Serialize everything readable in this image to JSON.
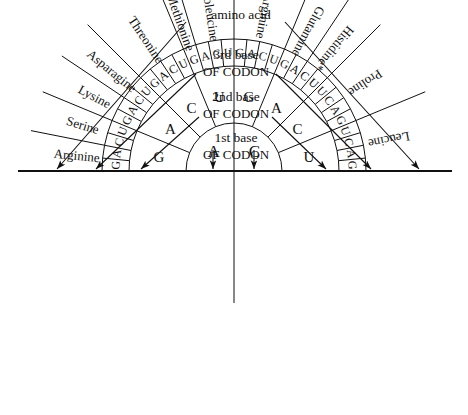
{
  "header": {
    "amino_acid": "amino acid",
    "third_base_l1": "3rd base",
    "third_base_l2": "OF CODON",
    "second_base_l1": "2nd base",
    "second_base_l2": "OF CODON",
    "first_base_l1": "1st base",
    "first_base_l2": "OF CODON"
  },
  "colors": {
    "line": "#111111",
    "background": "#ffffff",
    "text": "#111111"
  },
  "wheel": {
    "center_x": 234,
    "center_y": 171,
    "r_inner": 48,
    "r_ring2": 105,
    "r_ring3": 132,
    "r_labels": 175
  },
  "ring1_first_base": [
    {
      "letter": "A",
      "start_deg": 180,
      "end_deg": 270
    },
    {
      "letter": "C",
      "start_deg": 270,
      "end_deg": 360
    }
  ],
  "ring2_second_base": [
    {
      "letter": "G",
      "start_deg": 180,
      "end_deg": 202.5
    },
    {
      "letter": "A",
      "start_deg": 202.5,
      "end_deg": 225
    },
    {
      "letter": "C",
      "start_deg": 225,
      "end_deg": 247.5
    },
    {
      "letter": "U",
      "start_deg": 247.5,
      "end_deg": 270
    },
    {
      "letter": "G",
      "start_deg": 270,
      "end_deg": 292.5
    },
    {
      "letter": "A",
      "start_deg": 292.5,
      "end_deg": 315
    },
    {
      "letter": "C",
      "start_deg": 315,
      "end_deg": 337.5
    },
    {
      "letter": "U",
      "start_deg": 337.5,
      "end_deg": 360
    }
  ],
  "ring3_third_base": [
    "G",
    "A",
    "C",
    "U",
    "G",
    "A",
    "C",
    "U",
    "G",
    "A",
    "C",
    "U",
    "G",
    "A",
    "C",
    "U",
    "G",
    "A",
    "C",
    "U",
    "G",
    "A",
    "C",
    "U",
    "U",
    "C",
    "A",
    "G",
    "U",
    "C",
    "A",
    "G"
  ],
  "amino_acids": [
    {
      "name": "Arginine",
      "third_bases": [
        "G",
        "A"
      ],
      "mid_deg": 185.5
    },
    {
      "name": "Serine",
      "third_bases": [
        "C",
        "U"
      ],
      "mid_deg": 196.5
    },
    {
      "name": "Lysine",
      "third_bases": [
        "G",
        "A"
      ],
      "mid_deg": 208
    },
    {
      "name": "Asparagine",
      "third_bases": [
        "C",
        "U"
      ],
      "mid_deg": 219
    },
    {
      "name": "Threonine",
      "third_bases": [
        "G",
        "A",
        "C",
        "U"
      ],
      "mid_deg": 236
    },
    {
      "name": "Methionine",
      "third_bases": [
        "G"
      ],
      "mid_deg": 250.5
    },
    {
      "name": "Isoleucine",
      "third_bases": [
        "A",
        "C",
        "U"
      ],
      "mid_deg": 263
    },
    {
      "name": "Arginine",
      "third_bases": [
        "G",
        "A",
        "C",
        "U"
      ],
      "mid_deg": 281
    },
    {
      "name": "Glutamine",
      "third_bases": [
        "G",
        "A"
      ],
      "mid_deg": 296
    },
    {
      "name": "Histidine*",
      "third_bases": [
        "C",
        "U"
      ],
      "mid_deg": 307.5
    },
    {
      "name": "Proline",
      "third_bases": [
        "G",
        "A",
        "C",
        "U"
      ],
      "mid_deg": 326
    },
    {
      "name": "Leucine",
      "third_bases": [
        "G",
        "A",
        "C",
        "U"
      ],
      "mid_deg": 349
    }
  ],
  "arrows": [
    {
      "id": "arrow-1",
      "tip_x": 57,
      "tip_y": 169,
      "from_x": 186,
      "from_y": 22
    },
    {
      "id": "arrow-2",
      "tip_x": 96,
      "tip_y": 169,
      "from_x": 196,
      "from_y": 74
    },
    {
      "id": "arrow-3",
      "tip_x": 141,
      "tip_y": 169,
      "from_x": 199,
      "from_y": 117
    },
    {
      "id": "arrow-4",
      "tip_x": 213,
      "tip_y": 169,
      "from_x": 213,
      "from_y": 150
    },
    {
      "id": "arrow-5",
      "tip_x": 254,
      "tip_y": 169,
      "from_x": 254,
      "from_y": 150
    },
    {
      "id": "arrow-6",
      "tip_x": 326,
      "tip_y": 169,
      "from_x": 272,
      "from_y": 117
    },
    {
      "id": "arrow-7",
      "tip_x": 371,
      "tip_y": 169,
      "from_x": 276,
      "from_y": 74
    },
    {
      "id": "arrow-8",
      "tip_x": 419,
      "tip_y": 169,
      "from_x": 285,
      "from_y": 22
    }
  ],
  "baseline": {
    "x1": 18,
    "x2": 452,
    "y": 171
  }
}
